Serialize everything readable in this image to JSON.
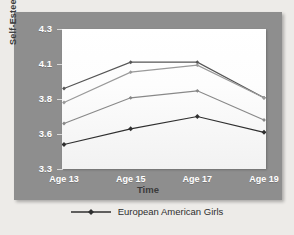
{
  "figure": {
    "panel_bg": "#8e8e8e",
    "page_bg": "#edebe8",
    "plot_bg": "#ffffff"
  },
  "axes": {
    "ylabel": "Self-Esteem",
    "xlabel": "Time",
    "yticks": [
      "4.3",
      "4.1",
      "3.8",
      "3.6",
      "3.3"
    ],
    "xticks": [
      "Age 13",
      "Age 15",
      "Age 17",
      "Age 19"
    ]
  },
  "legend": {
    "entries": [
      {
        "label": "European American Girls",
        "color": "#2f2f2f",
        "marker": "diamond"
      }
    ],
    "position": "bottom-center"
  },
  "chart_data": {
    "type": "line",
    "title": "",
    "subtitle": "",
    "xlabel": "Time",
    "ylabel": "Self-Esteem",
    "x": [
      "Age 13",
      "Age 15",
      "Age 17",
      "Age 19"
    ],
    "categories": [
      "Age 13",
      "Age 15",
      "Age 17",
      "Age 19"
    ],
    "ytick_labels": [
      "4.3",
      "4.1",
      "3.8",
      "3.6",
      "3.3"
    ],
    "ytick_values": [
      4.3,
      4.1,
      3.8,
      3.6,
      3.3
    ],
    "ylim": [
      3.3,
      4.3
    ],
    "grid": false,
    "legend_position": "bottom-center",
    "series": [
      {
        "name": "series-4-top",
        "color": "#555555",
        "marker": "diamond",
        "values": [
          3.89,
          4.11,
          4.11,
          3.81
        ]
      },
      {
        "name": "series-3",
        "color": "#9a9a9a",
        "marker": "diamond",
        "values": [
          3.78,
          4.03,
          4.09,
          3.81
        ]
      },
      {
        "name": "series-2",
        "color": "#888888",
        "marker": "diamond",
        "values": [
          3.66,
          3.81,
          3.87,
          3.68
        ]
      },
      {
        "name": "European American Girls",
        "color": "#2f2f2f",
        "marker": "diamond",
        "values": [
          3.51,
          3.63,
          3.7,
          3.61
        ]
      }
    ]
  }
}
